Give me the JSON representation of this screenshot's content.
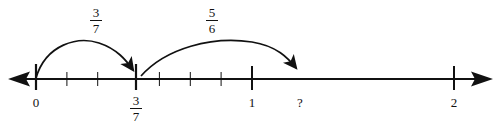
{
  "figure": {
    "type": "number-line-hops",
    "axis": {
      "min_value": 0,
      "max_value": 2,
      "left_arrow": true,
      "right_arrow": true,
      "subdivision": "sevenths",
      "ticks_per_unit": 7
    },
    "tick_labels": [
      {
        "name": "zero",
        "text": "0",
        "value": 0,
        "x": 36,
        "style": "plain"
      },
      {
        "name": "three-sevenths",
        "numerator": "3",
        "denominator": "7",
        "value": 0.4286,
        "x": 136,
        "style": "fraction"
      },
      {
        "name": "one",
        "text": "1",
        "value": 1,
        "x": 252,
        "style": "plain"
      },
      {
        "name": "question",
        "text": "?",
        "value": 1.238,
        "x": 300,
        "style": "plain"
      },
      {
        "name": "two",
        "text": "2",
        "value": 2,
        "x": 454,
        "style": "plain"
      }
    ],
    "hops": [
      {
        "name": "first-hop",
        "numerator": "3",
        "denominator": "7",
        "label_x": 96,
        "label_y": 6,
        "start_x": 36,
        "end_x": 136
      },
      {
        "name": "second-hop",
        "numerator": "5",
        "denominator": "6",
        "label_x": 212,
        "label_y": 6,
        "start_x": 141,
        "end_x": 300
      }
    ],
    "colors": {
      "ink": "#111111",
      "background": "#ffffff"
    }
  }
}
